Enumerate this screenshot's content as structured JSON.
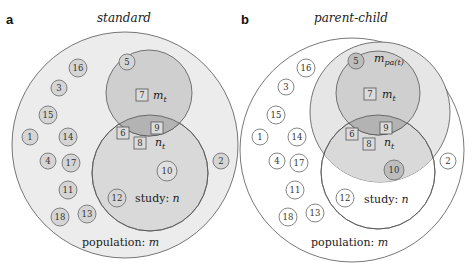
{
  "panels": [
    {
      "label": "a",
      "title": "standard",
      "population_label": "population: ",
      "population_var": "m",
      "study_label": "study: ",
      "study_var": "n",
      "mt_label": "m",
      "mt_sub": "t",
      "nt_label": "n",
      "nt_sub": "t"
    },
    {
      "label": "b",
      "title": "parent-child",
      "population_label": "population: ",
      "population_var": "m",
      "study_label": "study: ",
      "study_var": "n",
      "mt_label": "m",
      "mt_sub": "t",
      "nt_label": "n",
      "nt_sub": "t",
      "mpa_label": "m",
      "mpa_sub": "pa(t)"
    }
  ],
  "nodes": {
    "circles": [
      "16",
      "5",
      "3",
      "15",
      "1",
      "14",
      "4",
      "17",
      "11",
      "18",
      "13",
      "12",
      "10",
      "2"
    ],
    "squares": [
      "7",
      "6",
      "9",
      "8"
    ]
  },
  "colors": {
    "population_fill_a": "#ececec",
    "population_fill_b": "#ffffff",
    "mpa_fill": "#e6e6e6",
    "mt_fill": "#cfcfcf",
    "study_fill": "#d9d9d9",
    "overlap_fill": "#b3b3b3",
    "stroke": "#555555"
  }
}
